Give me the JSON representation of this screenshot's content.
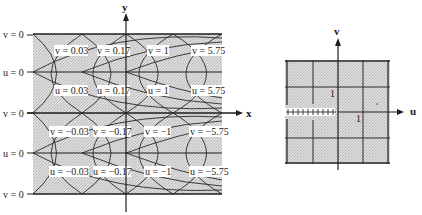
{
  "left_diagram": {
    "x_axis_label": "x",
    "y_axis_label": "y",
    "boundary_labels": [
      "v = 0",
      "u = 0",
      "v = 0",
      "u = 0",
      "v = 0"
    ],
    "rows": [
      {
        "labels": [
          "v = 0.03",
          "v = 0.17",
          "v = 1",
          "v = 5.75"
        ]
      },
      {
        "labels": [
          "u = 0.03",
          "u = 0.17",
          "u = 1",
          "u = 5.75"
        ]
      },
      {
        "labels": [
          "v = −0.03",
          "v = −0.17",
          "v = −1",
          "v = −5.75"
        ]
      },
      {
        "labels": [
          "u = −0.03",
          "u = −0.17",
          "u = −1",
          "u = −5.75"
        ]
      }
    ]
  },
  "right_diagram": {
    "u_axis_label": "u",
    "v_axis_label": "v",
    "tick_label_v": "1",
    "tick_label_u": "1"
  },
  "colors": {
    "shade": "#d4d4d4",
    "line": "#2a2a2a",
    "background": "#ffffff"
  }
}
